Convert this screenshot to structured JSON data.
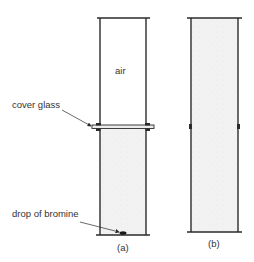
{
  "diagram": {
    "colors": {
      "line": "#2a2a2a",
      "gas_fill": "#f1f1f1",
      "background": "#ffffff",
      "text": "#333333"
    },
    "jar_a": {
      "caption": "(a)",
      "upper_label": "air",
      "cover_glass_label": "cover glass",
      "drop_label": "drop of bromine",
      "upper_contents": "air",
      "lower_contents": "bromine vapour"
    },
    "jar_b": {
      "caption": "(b)",
      "contents": "bromine vapour throughout"
    }
  }
}
